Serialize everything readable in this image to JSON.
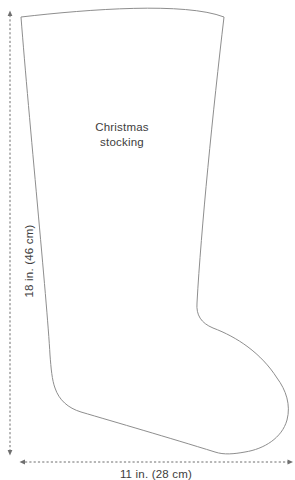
{
  "diagram": {
    "title_line1": "Christmas",
    "title_line2": "stocking",
    "height_dimension": {
      "label": "18 in. (46 cm)"
    },
    "width_dimension": {
      "label": "11 in. (28 cm)"
    },
    "colors": {
      "outline": "#8e8e8e",
      "dimension_line": "#6f6f6f",
      "text": "#3d3d3d",
      "background": "#ffffff"
    }
  }
}
